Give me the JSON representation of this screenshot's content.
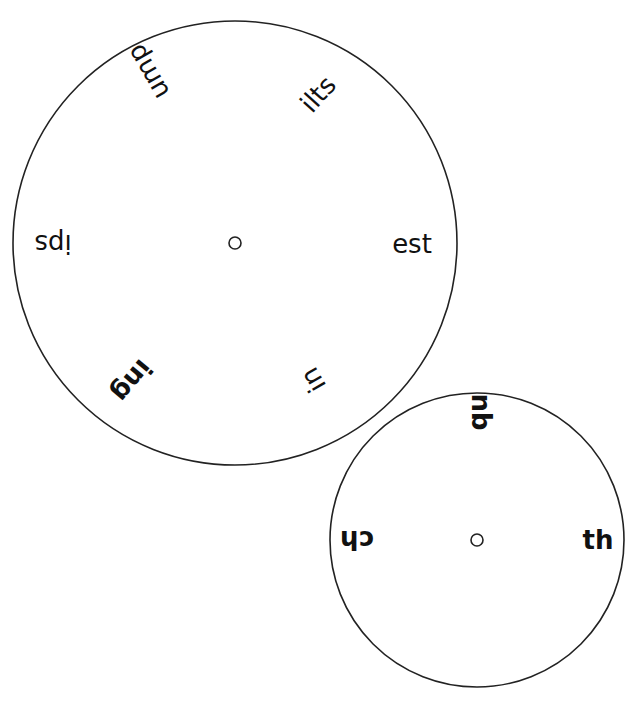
{
  "wheels": {
    "outer": {
      "description": "Large word-ending wheel",
      "center": [
        235,
        243
      ],
      "radius": 222,
      "labels": [
        {
          "text": "ump",
          "x": 148,
          "y": 72,
          "rotate": 240,
          "bold": false
        },
        {
          "text": "ilts",
          "x": 318,
          "y": 94,
          "rotate": -48,
          "bold": false
        },
        {
          "text": "ips",
          "x": 53,
          "y": 244,
          "rotate": 180,
          "bold": false
        },
        {
          "text": "est",
          "x": 412,
          "y": 244,
          "rotate": 0,
          "bold": false
        },
        {
          "text": "ing",
          "x": 132,
          "y": 381,
          "rotate": 130,
          "bold": true
        },
        {
          "text": "in",
          "x": 313,
          "y": 380,
          "rotate": 240,
          "bold": false
        }
      ]
    },
    "inner": {
      "description": "Small digraph wheel",
      "center": [
        477,
        540
      ],
      "radius": 147,
      "labels": [
        {
          "text": "qu",
          "x": 478,
          "y": 412,
          "rotate": -90,
          "bold": true
        },
        {
          "text": "ch",
          "x": 357,
          "y": 540,
          "rotate": 180,
          "bold": true
        },
        {
          "text": "th",
          "x": 598,
          "y": 540,
          "rotate": 0,
          "bold": true
        }
      ]
    }
  },
  "colors": {
    "stroke": "#222222",
    "text": "#111111",
    "background": "#ffffff"
  }
}
